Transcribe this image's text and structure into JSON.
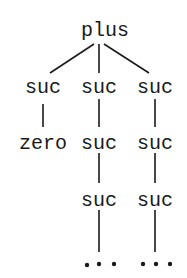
{
  "tree": {
    "root": "plus",
    "level1": [
      "suc",
      "suc",
      "suc"
    ],
    "level2": [
      "zero",
      "suc",
      "suc"
    ],
    "level3": [
      "suc",
      "suc"
    ],
    "ellipsis": [
      "...",
      "..."
    ]
  }
}
